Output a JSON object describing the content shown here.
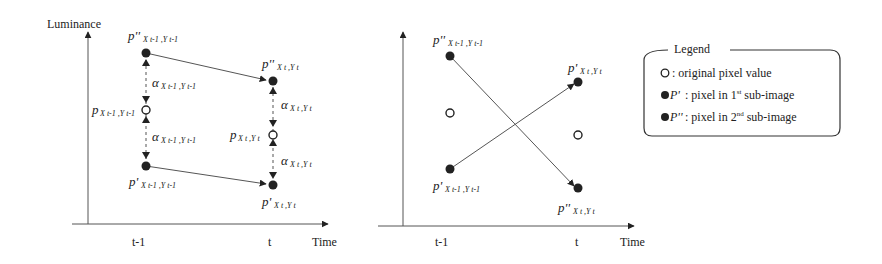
{
  "left_diagram": {
    "y_axis_label": "Luminance",
    "x_axis_label": "Time",
    "ticks": [
      "t-1",
      "t"
    ],
    "labels": {
      "p2_prev": {
        "base": "p''",
        "sub": "x_{t-1},y_{t-1}",
        "sub_text": "X t-1 ,Y t-1"
      },
      "p2_cur": {
        "base": "p''",
        "sub": "x_t,y_t",
        "sub_text": "X t ,Y t"
      },
      "p_prev": {
        "base": "p",
        "sub": "x_{t-1},y_{t-1}",
        "sub_text": "X t-1 ,Y t-1"
      },
      "p_cur": {
        "base": "p",
        "sub": "x_t,y_t",
        "sub_text": "X t ,Y t"
      },
      "p1_prev": {
        "base": "p'",
        "sub": "x_{t-1},y_{t-1}",
        "sub_text": "X t-1 ,Y t-1"
      },
      "p1_cur": {
        "base": "p'",
        "sub": "x_t,y_t",
        "sub_text": "X t ,Y t"
      },
      "alpha_prev_top": {
        "base": "α",
        "sub_text": "X t-1 ,Y t-1"
      },
      "alpha_prev_bottom": {
        "base": "α",
        "sub_text": "X t-1 ,Y t-1"
      },
      "alpha_cur_top": {
        "base": "α",
        "sub_text": "X t ,Y t"
      },
      "alpha_cur_bottom": {
        "base": "α",
        "sub_text": "X t ,Y t"
      }
    }
  },
  "right_diagram": {
    "x_axis_label": "Time",
    "ticks": [
      "t-1",
      "t"
    ],
    "labels": {
      "p2_prev": {
        "base": "p''",
        "sub_text": "X t-1 ,Y t-1"
      },
      "p1_prev": {
        "base": "p'",
        "sub_text": "X t-1 ,Y t-1"
      },
      "p1_cur": {
        "base": "p'",
        "sub_text": "X t ,Y t"
      },
      "p2_cur": {
        "base": "p''",
        "sub_text": "X t ,Y t"
      }
    }
  },
  "legend": {
    "title": "Legend",
    "items": [
      {
        "symbol": "open-circle",
        "prefix": "",
        "text": ": original pixel value"
      },
      {
        "symbol": "filled-circle",
        "prefix": "P'",
        "text": ": pixel in 1",
        "sup": "st",
        "after": " sub-image"
      },
      {
        "symbol": "filled-circle",
        "prefix": "P''",
        "text": ": pixel in 2",
        "sup": "nd",
        "after": " sub-image"
      }
    ]
  },
  "colors": {
    "ink": "#222222",
    "line": "#555555",
    "background": "#ffffff"
  }
}
